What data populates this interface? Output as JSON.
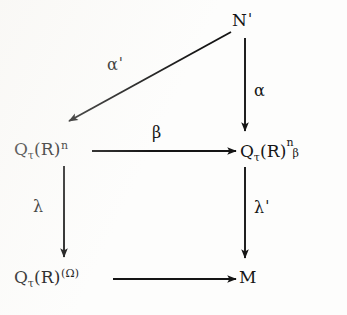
{
  "figure": {
    "kind": "commutative-diagram",
    "background_color": "#fdfdfc",
    "ink_color": "#151515",
    "nodes": [
      {
        "id": "n-prime",
        "label": "N'",
        "base": "N",
        "prime": "'",
        "position": "top-right"
      },
      {
        "id": "q-tau-r-n",
        "label": "Q_t(R)^n",
        "base": "Q",
        "subscript": "τ",
        "middle": "(R)",
        "superscript": "n",
        "position": "middle-left"
      },
      {
        "id": "q-tau-r-n-beta",
        "label": "Q_t(R)^n_beta",
        "base": "Q",
        "subscript": "τ",
        "middle": "(R)",
        "superscript": "n",
        "subscript2": "β",
        "position": "middle-right"
      },
      {
        "id": "q-tau-r-omega",
        "label": "Q_t(R)^(Omega)",
        "base": "Q",
        "subscript": "τ",
        "middle": "(R)",
        "superscript": "(Ω)",
        "position": "bottom-left"
      },
      {
        "id": "m",
        "label": "M",
        "base": "M",
        "position": "bottom-right"
      }
    ],
    "edges": [
      {
        "id": "alpha-prime",
        "from": "n-prime",
        "to": "q-tau-r-n",
        "label": "α'",
        "label_base": "α",
        "label_prime": "'",
        "direction": "diagonal-down-left"
      },
      {
        "id": "alpha",
        "from": "n-prime",
        "to": "q-tau-r-n-beta",
        "label": "α",
        "label_base": "α",
        "label_prime": "",
        "direction": "down"
      },
      {
        "id": "beta",
        "from": "q-tau-r-n",
        "to": "q-tau-r-n-beta",
        "label": "β",
        "label_base": "β",
        "label_prime": "",
        "direction": "right"
      },
      {
        "id": "lambda",
        "from": "q-tau-r-n",
        "to": "q-tau-r-omega",
        "label": "λ",
        "label_base": "λ",
        "label_prime": "",
        "direction": "down"
      },
      {
        "id": "lambda-prime",
        "from": "q-tau-r-n-beta",
        "to": "m",
        "label": "λ'",
        "label_base": "λ",
        "label_prime": "'",
        "direction": "down"
      },
      {
        "id": "unlabeled-bottom",
        "from": "q-tau-r-omega",
        "to": "m",
        "label": "",
        "label_base": "",
        "label_prime": "",
        "direction": "right"
      }
    ]
  }
}
